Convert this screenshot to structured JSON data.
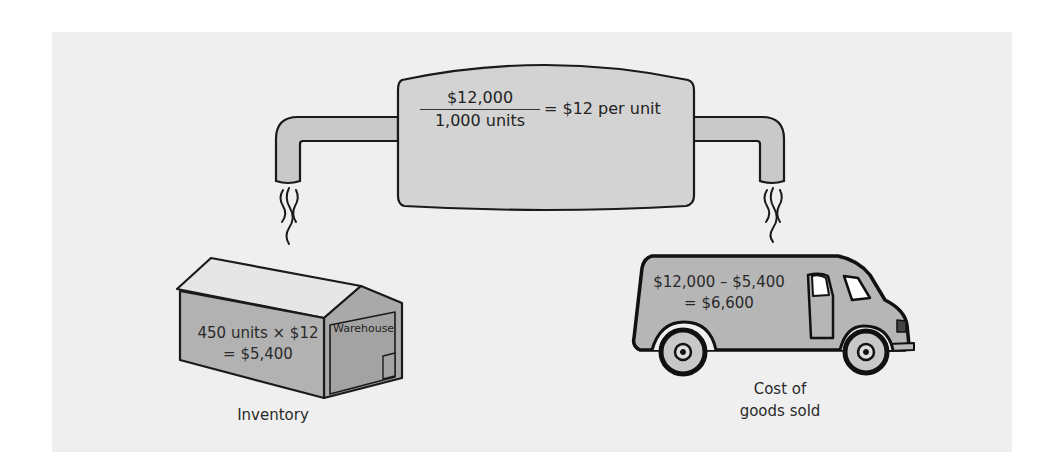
{
  "diagram": {
    "type": "cost-flow",
    "background_color": "#efefef",
    "fill_color": "#cccccc",
    "stroke_color": "#1a1a1a",
    "tank": {
      "numerator": "$12,000",
      "denominator": "1,000 units",
      "result": "= $12 per unit"
    },
    "inventory": {
      "line1": "450 units × $12",
      "line2": "= $5,400",
      "sign": "Warehouse",
      "caption": "Inventory"
    },
    "cogs": {
      "line1": "$12,000 – $5,400",
      "line2": "= $6,600",
      "caption_line1": "Cost of",
      "caption_line2": "goods sold"
    }
  }
}
